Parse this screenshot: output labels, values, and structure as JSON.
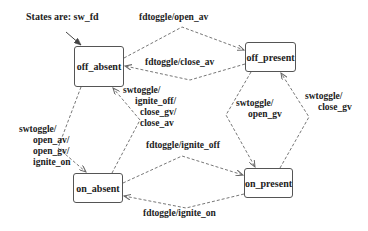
{
  "title": "States are: sw_fd",
  "states": [
    {
      "id": "off_absent",
      "label": "off_absent"
    },
    {
      "id": "off_present",
      "label": "off_present"
    },
    {
      "id": "on_absent",
      "label": "on_absent"
    },
    {
      "id": "on_present",
      "label": "on_present"
    }
  ],
  "transitions": [
    {
      "from": "off_absent",
      "to": "off_present",
      "label": "fdtoggle/open_av"
    },
    {
      "from": "off_present",
      "to": "off_absent",
      "label": "fdtoggle/close_av"
    },
    {
      "from": "off_absent",
      "to": "on_absent",
      "label_lines": [
        "swtoggle/",
        "open_av/",
        "open_gv/",
        "ignite_on"
      ]
    },
    {
      "from": "on_absent",
      "to": "off_absent",
      "label_lines": [
        "swtoggle/",
        "ignite_off/",
        "close_gv/",
        "close_av"
      ]
    },
    {
      "from": "off_present",
      "to": "on_present",
      "label_lines": [
        "swtoggle/",
        "open_gv"
      ]
    },
    {
      "from": "on_present",
      "to": "off_present",
      "label_lines": [
        "swtoggle/",
        "close_gv"
      ]
    },
    {
      "from": "on_absent",
      "to": "on_present",
      "label": "fdtoggle/ignite_off"
    },
    {
      "from": "on_present",
      "to": "on_absent",
      "label": "fdtoggle/ignite_on"
    }
  ],
  "colors": {
    "line": "#666666",
    "text": "#222222",
    "background": "#ffffff"
  }
}
